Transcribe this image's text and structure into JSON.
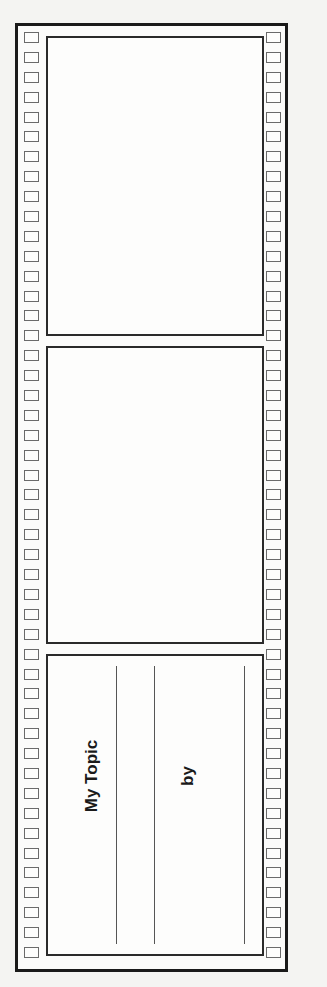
{
  "worksheet": {
    "type": "filmstrip-template",
    "frames": [
      {
        "id": "frame-1",
        "content": ""
      },
      {
        "id": "frame-2",
        "content": ""
      },
      {
        "id": "title-frame",
        "title_label": "My Topic",
        "byline_label": "by",
        "writing_lines": 3
      }
    ],
    "sprocket_holes_per_side": 47,
    "colors": {
      "border": "#1a1a1a",
      "paper": "#fbfbfa",
      "hole_outline": "#6a6a6a"
    }
  }
}
